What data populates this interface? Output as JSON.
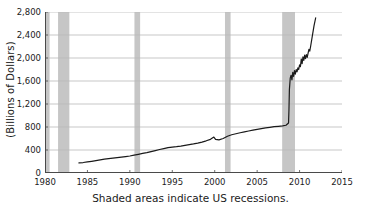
{
  "chart_data": {
    "type": "line",
    "title": "",
    "subtitle": "",
    "xlabel": "",
    "ylabel": "(Billions of Dollars)",
    "caption": "Shaded areas indicate US recessions.",
    "xlim": [
      1980,
      2015
    ],
    "ylim": [
      0,
      2800
    ],
    "grid": true,
    "grid_axis": "y",
    "legend": "none",
    "line_color": "#1a1a1a",
    "recession_color": "#c6c6c6",
    "grid_color": "#b9b9b9",
    "axis_color": "#4a4a4a",
    "xticks": [
      1980,
      1985,
      1990,
      1995,
      2000,
      2005,
      2010,
      2015
    ],
    "xtick_labels": [
      "1980",
      "1985",
      "1990",
      "1995",
      "2000",
      "2005",
      "2010",
      "2015"
    ],
    "yticks": [
      0,
      400,
      800,
      1200,
      1600,
      2000,
      2400,
      2800
    ],
    "ytick_labels": [
      "0",
      "400",
      "800",
      "1,200",
      "1,600",
      "2,000",
      "2,400",
      "2,800"
    ],
    "series": [
      {
        "name": "Monetary Base",
        "x": [
          1984.0,
          1984.5,
          1985.0,
          1985.5,
          1986.0,
          1986.5,
          1987.0,
          1987.5,
          1988.0,
          1988.5,
          1989.0,
          1989.5,
          1990.0,
          1990.5,
          1991.0,
          1991.5,
          1992.0,
          1992.5,
          1993.0,
          1993.5,
          1994.0,
          1994.5,
          1995.0,
          1995.5,
          1996.0,
          1996.5,
          1997.0,
          1997.5,
          1998.0,
          1998.5,
          1999.0,
          1999.5,
          1999.9,
          2000.1,
          2000.5,
          2001.0,
          2001.5,
          2002.0,
          2002.5,
          2003.0,
          2003.5,
          2004.0,
          2004.5,
          2005.0,
          2005.5,
          2006.0,
          2006.5,
          2007.0,
          2007.5,
          2008.0,
          2008.4,
          2008.7,
          2008.75,
          2008.8,
          2008.9,
          2009.0,
          2009.1,
          2009.2,
          2009.3,
          2009.4,
          2009.5,
          2009.6,
          2009.7,
          2009.8,
          2009.9,
          2010.0,
          2010.1,
          2010.2,
          2010.3,
          2010.4,
          2010.5,
          2010.6,
          2010.7,
          2010.8,
          2010.9,
          2011.0,
          2011.1,
          2011.2,
          2011.3,
          2011.5,
          2011.7,
          2011.9
        ],
        "y": [
          175,
          182,
          192,
          203,
          215,
          228,
          240,
          250,
          258,
          266,
          275,
          285,
          296,
          310,
          325,
          340,
          355,
          372,
          390,
          408,
          425,
          440,
          450,
          458,
          468,
          480,
          492,
          505,
          520,
          538,
          560,
          585,
          625,
          585,
          575,
          600,
          640,
          665,
          682,
          700,
          715,
          730,
          745,
          760,
          772,
          785,
          795,
          805,
          812,
          820,
          830,
          870,
          1100,
          1450,
          1650,
          1700,
          1620,
          1750,
          1680,
          1780,
          1720,
          1800,
          1760,
          1830,
          1800,
          1880,
          1850,
          1980,
          1900,
          2020,
          1960,
          2050,
          1990,
          2060,
          2010,
          2080,
          2150,
          2120,
          2200,
          2380,
          2560,
          2700
        ]
      }
    ],
    "recessions": [
      {
        "label": "Jan 1980 – Jul 1980",
        "start": 1980.0,
        "end": 1980.54
      },
      {
        "label": "Jul 1981 – Nov 1982",
        "start": 1981.54,
        "end": 1982.87
      },
      {
        "label": "Jul 1990 – Mar 1991",
        "start": 1990.54,
        "end": 1991.21
      },
      {
        "label": "Mar 2001 – Nov 2001",
        "start": 2001.21,
        "end": 2001.87
      },
      {
        "label": "Dec 2007 – Jun 2009",
        "start": 2007.95,
        "end": 2009.46
      }
    ]
  }
}
